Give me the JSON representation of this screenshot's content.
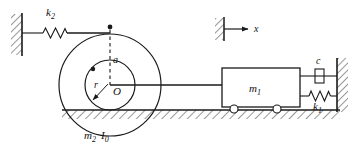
{
  "figure": {
    "type": "mechanical-schematic",
    "background_color": "#ffffff",
    "line_color": "#1a1a1a"
  },
  "labels": {
    "spring_left": "k",
    "spring_left_sub": "2",
    "spring_right": "k",
    "spring_right_sub": "1",
    "damper": "c",
    "mass_sliding": "m",
    "mass_sliding_sub": "1",
    "mass_cylinder": "m",
    "mass_cylinder_sub": "2",
    "inertia": "I",
    "inertia_sub": "0",
    "center": "O",
    "radius_inner": "r",
    "offset_a": "a",
    "coordinate_x": "x"
  },
  "components": {
    "left_wall": {
      "name": "fixed support left",
      "x": 22,
      "y_top": 14,
      "y_bottom": 55
    },
    "right_wall": {
      "name": "fixed support right",
      "x": 337,
      "y_top": 58,
      "y_bottom": 112
    },
    "ground": {
      "name": "hatched ground surface",
      "x_start": 62,
      "x_end": 340,
      "y": 110
    },
    "outer_circle": {
      "cx": 110,
      "cy": 85,
      "r": 51
    },
    "inner_circle": {
      "cx": 110,
      "cy": 85,
      "r": 25
    },
    "attachment_dot": {
      "cx": 110,
      "cy": 27
    },
    "inner_dot": {
      "cx": 94,
      "cy": 70
    },
    "mass_box": {
      "x": 222,
      "y": 68,
      "w": 78,
      "h": 39
    },
    "wheels": [
      {
        "cx": 234,
        "cy": 109
      },
      {
        "cx": 277,
        "cy": 109
      }
    ],
    "x_axis_ref": {
      "wall_x": 224,
      "y_top": 18,
      "y_bottom": 40,
      "arrow_y": 29,
      "arrow_end": 253
    }
  }
}
